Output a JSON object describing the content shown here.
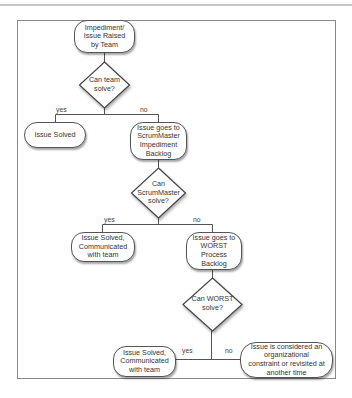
{
  "diagram": {
    "type": "flowchart",
    "nodes": {
      "start": {
        "label": "Impediment/\nIssue Raised\nby Team",
        "shape": "rounded-rect"
      },
      "decision_team": {
        "label": "Can team\nsolve?",
        "shape": "diamond"
      },
      "solved_team": {
        "label": "Issue Solved",
        "shape": "rounded-rect"
      },
      "sm_backlog": {
        "label": "Issue goes to\nScrumMaster\nImpediment\nBacklog",
        "shape": "rounded-rect"
      },
      "decision_sm": {
        "label": "Can\nScrumMaster\nsolve?",
        "shape": "diamond"
      },
      "solved_sm": {
        "label": "Issue Solved,\nCommunicated\nwith team",
        "shape": "rounded-rect"
      },
      "worst_backlog": {
        "label": "Issue goes to\nWORST\nProcess\nBacklog",
        "shape": "rounded-rect"
      },
      "decision_worst": {
        "label": "Can WORST\nsolve?",
        "shape": "diamond"
      },
      "solved_worst": {
        "label": "Issue Solved,\nCommunicated\nwith team",
        "shape": "rounded-rect"
      },
      "constraint": {
        "label": "Issue is considered an\norganizational\nconstraint or revisited at\nanother time",
        "shape": "rounded-rect"
      }
    },
    "edges": [
      {
        "from": "start",
        "to": "decision_team",
        "label": ""
      },
      {
        "from": "decision_team",
        "to": "solved_team",
        "label": "yes"
      },
      {
        "from": "decision_team",
        "to": "sm_backlog",
        "label": "no"
      },
      {
        "from": "sm_backlog",
        "to": "decision_sm",
        "label": ""
      },
      {
        "from": "decision_sm",
        "to": "solved_sm",
        "label": "yes"
      },
      {
        "from": "decision_sm",
        "to": "worst_backlog",
        "label": "no"
      },
      {
        "from": "worst_backlog",
        "to": "decision_worst",
        "label": ""
      },
      {
        "from": "decision_worst",
        "to": "solved_worst",
        "label": "yes"
      },
      {
        "from": "decision_worst",
        "to": "constraint",
        "label": "no"
      }
    ],
    "edge_labels": {
      "yes": "yes",
      "no": "no"
    }
  }
}
